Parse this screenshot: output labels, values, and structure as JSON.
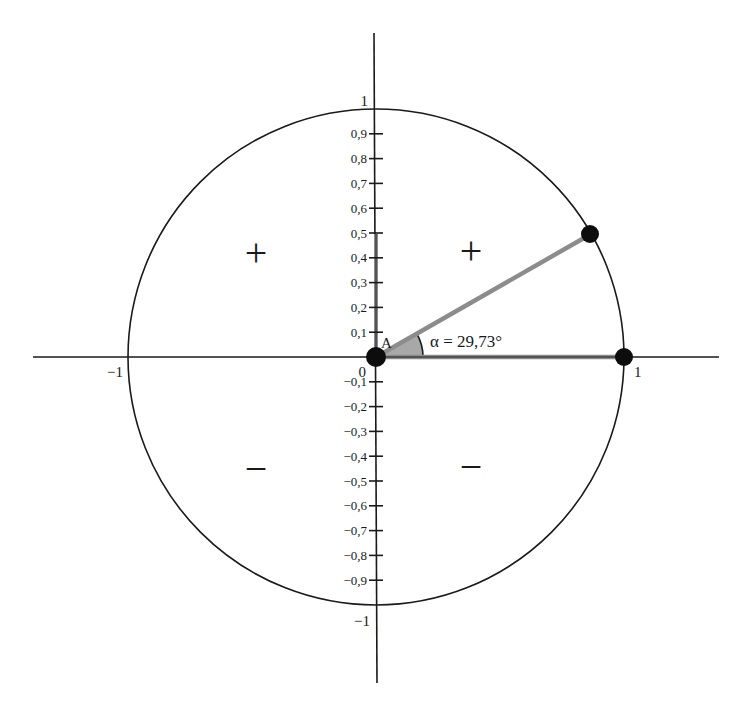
{
  "diagram": {
    "type": "unit-circle",
    "center_label": "0",
    "point_label": "A",
    "angle": {
      "symbol": "α",
      "value_deg": 29.73,
      "label": "α = 29,73°"
    },
    "x_axis": {
      "min_label": "−1",
      "max_label": "1"
    },
    "y_axis": {
      "top_label": "1",
      "bottom_label": "−1",
      "positive_ticks": [
        "0,1",
        "0,2",
        "0,3",
        "0,4",
        "0,5",
        "0,6",
        "0,7",
        "0,8",
        "0,9"
      ],
      "negative_ticks": [
        "−0,1",
        "−0,2",
        "−0,3",
        "−0,4",
        "−0,5",
        "−0,6",
        "−0,7",
        "−0,8",
        "−0,9"
      ]
    },
    "quadrant_signs": {
      "q2": "+",
      "q1": "+",
      "q3": "−",
      "q4": "−"
    },
    "colors": {
      "line": "#1a1a1a",
      "highlight": "#8c8c8c",
      "sector_fill": "#a8a8a8",
      "dot": "#0d0d0d"
    },
    "points": [
      {
        "name": "origin",
        "x": 0,
        "y": 0
      },
      {
        "name": "circle-point",
        "x": 0.868,
        "y": 0.496
      },
      {
        "name": "x-intercept",
        "x": 1,
        "y": 0
      }
    ]
  }
}
